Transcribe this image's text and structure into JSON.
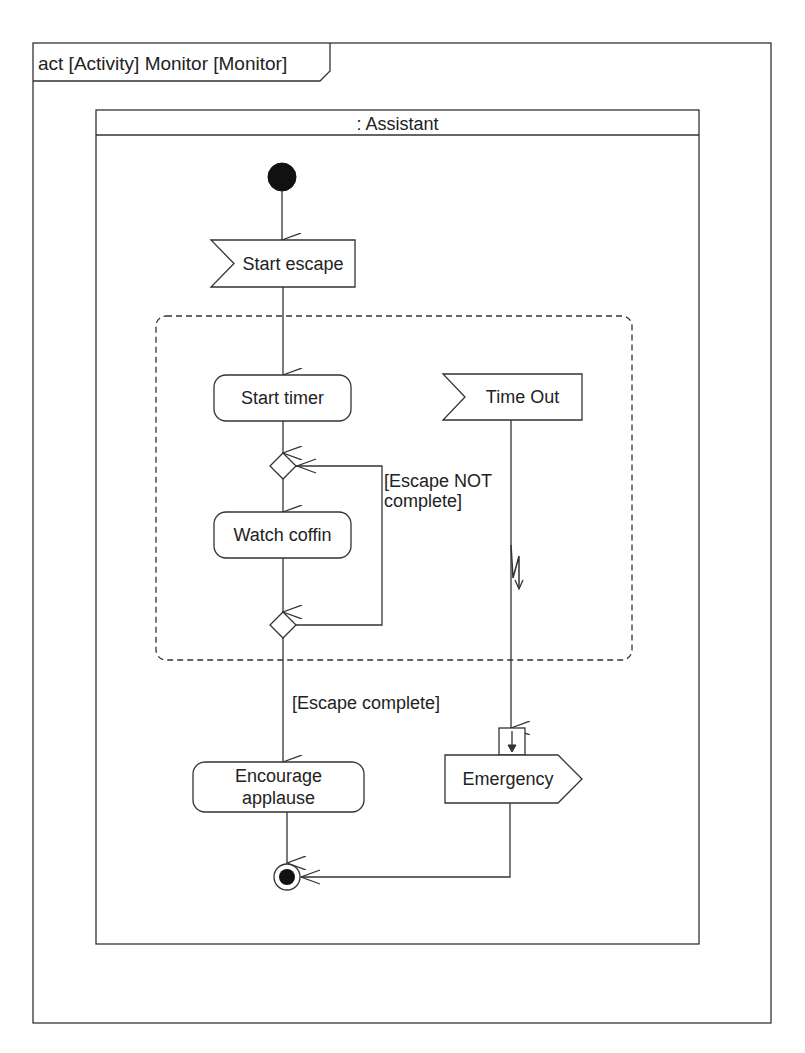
{
  "frame": {
    "title": "act [Activity] Monitor [Monitor]"
  },
  "partition": {
    "name": ": Assistant"
  },
  "nodes": {
    "initial": {
      "type": "initial-node"
    },
    "start_escape": {
      "type": "accept-event",
      "label": "Start escape"
    },
    "start_timer": {
      "type": "action",
      "label": "Start timer"
    },
    "merge": {
      "type": "merge-node"
    },
    "watch_coffin": {
      "type": "action",
      "label": "Watch coffin"
    },
    "decision": {
      "type": "decision-node"
    },
    "time_out": {
      "type": "accept-event",
      "label": "Time Out"
    },
    "encourage_applause": {
      "type": "action",
      "label": "Encourage applause",
      "lines": [
        "Encourage",
        "applause"
      ]
    },
    "emergency": {
      "type": "send-signal",
      "label": "Emergency"
    },
    "final": {
      "type": "activity-final"
    }
  },
  "region": {
    "type": "interruptible-region"
  },
  "guards": {
    "not_complete": {
      "lines": [
        "[Escape NOT",
        "complete]"
      ]
    },
    "complete": "[Escape complete]"
  },
  "edges": [
    {
      "from": "initial",
      "to": "start_escape"
    },
    {
      "from": "start_escape",
      "to": "start_timer"
    },
    {
      "from": "start_timer",
      "to": "merge"
    },
    {
      "from": "merge",
      "to": "watch_coffin"
    },
    {
      "from": "watch_coffin",
      "to": "decision"
    },
    {
      "from": "decision",
      "to": "merge",
      "guard": "[Escape NOT complete]"
    },
    {
      "from": "decision",
      "to": "encourage_applause",
      "guard": "[Escape complete]"
    },
    {
      "from": "time_out",
      "to": "emergency",
      "interrupting": true
    },
    {
      "from": "encourage_applause",
      "to": "final"
    },
    {
      "from": "emergency",
      "to": "final"
    }
  ],
  "colors": {
    "stroke": "#333333",
    "fill": "#ffffff",
    "text": "#222222"
  }
}
